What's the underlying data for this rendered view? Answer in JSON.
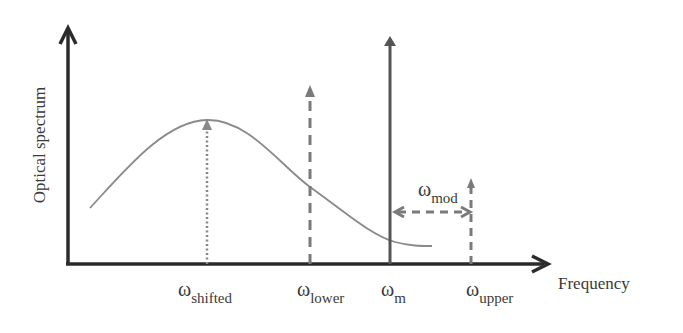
{
  "diagram": {
    "y_axis_label": "Optical spectrum",
    "x_axis_label": "Frequency",
    "omega": "ω",
    "labels": {
      "shifted": {
        "sub": "shifted"
      },
      "lower": {
        "sub": "lower"
      },
      "m": {
        "sub": "m"
      },
      "upper": {
        "sub": "upper"
      },
      "mod": {
        "sub": "mod"
      }
    },
    "colors": {
      "axis": "#2b2b2b",
      "curve": "#8a8a8a",
      "carrier": "#555555",
      "sideband": "#7a7a7a"
    }
  }
}
